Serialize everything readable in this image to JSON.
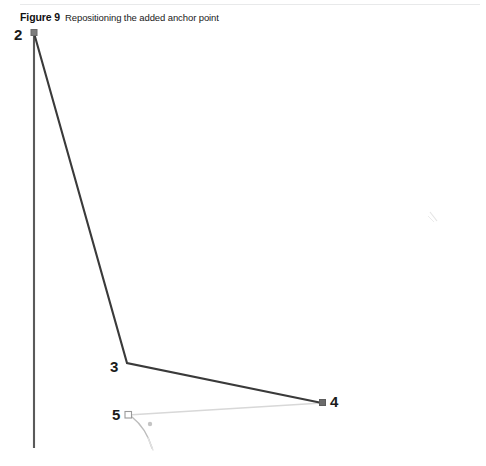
{
  "figure": {
    "label": "Figure 9",
    "caption": "Repositioning the added anchor point",
    "rule_color": "#e8e9ea",
    "background": "#ffffff"
  },
  "colors": {
    "path_stroke": "#3a3a3a",
    "axis_stroke": "#555555",
    "preview_stroke": "#d8d8d8",
    "handle_stroke": "#b9b9b9",
    "anchor_fill": "#ffffff",
    "anchor_stroke": "#9a9a9a",
    "anchor_solid": "#6b6b6b",
    "label_color": "#1b1b1b",
    "artifact": "#cfcfcf"
  },
  "callouts": [
    {
      "id": "2",
      "text": "2",
      "x": 14,
      "y": 27
    },
    {
      "id": "3",
      "text": "3",
      "x": 110,
      "y": 359
    },
    {
      "id": "4",
      "text": "4",
      "x": 330,
      "y": 394
    },
    {
      "id": "5",
      "text": "5",
      "x": 112,
      "y": 407
    }
  ],
  "artwork": {
    "anchor_points": [
      {
        "id": "2",
        "x": 34,
        "y": 33,
        "style": "solid-square"
      },
      {
        "id": "3",
        "x": 127,
        "y": 363,
        "style": "vertex"
      },
      {
        "id": "4",
        "x": 322,
        "y": 403,
        "style": "solid-square"
      },
      {
        "id": "5",
        "x": 128,
        "y": 415,
        "style": "hollow-square"
      }
    ],
    "vertical_line": {
      "x": 34,
      "y1": 33,
      "y2": 448
    },
    "path_segments": [
      {
        "from": "2",
        "to": "3",
        "x1": 34,
        "y1": 33,
        "x2": 127,
        "y2": 363
      },
      {
        "from": "3",
        "to": "4",
        "x1": 127,
        "y1": 363,
        "x2": 322,
        "y2": 403
      }
    ],
    "preview_segment": {
      "from": "5",
      "to": "4",
      "x1": 128,
      "y1": 415,
      "x2": 322,
      "y2": 403
    },
    "direction_handle": {
      "from": "5",
      "path": "M 132 417 Q 146 428 152 448",
      "dot": {
        "x": 150,
        "y": 424,
        "r": 2.2
      }
    },
    "artifact_mark": {
      "x": 428,
      "y": 214,
      "width": 10,
      "height": 10
    }
  }
}
